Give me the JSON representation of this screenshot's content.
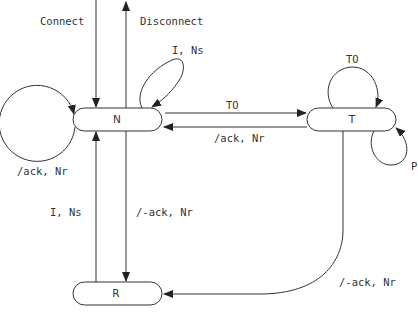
{
  "diagram": {
    "type": "state-transition",
    "nodes": [
      {
        "id": "N",
        "label": "N"
      },
      {
        "id": "T",
        "label": "T"
      },
      {
        "id": "R",
        "label": "R"
      }
    ],
    "edges": [
      {
        "id": "connect",
        "from": "external",
        "to": "N",
        "label": "Connect"
      },
      {
        "id": "disconnect",
        "from": "N",
        "to": "external",
        "label": "Disconnect"
      },
      {
        "id": "n-self-ins",
        "from": "N",
        "to": "N",
        "label": "I, Ns"
      },
      {
        "id": "n-self-ack",
        "from": "N",
        "to": "N",
        "label": "/ack, Nr"
      },
      {
        "id": "n-to-t",
        "from": "N",
        "to": "T",
        "label": "TO"
      },
      {
        "id": "t-to-n",
        "from": "T",
        "to": "N",
        "label": "/ack, Nr"
      },
      {
        "id": "t-self-to",
        "from": "T",
        "to": "T",
        "label": "TO"
      },
      {
        "id": "t-self-p",
        "from": "T",
        "to": "T",
        "label": "P"
      },
      {
        "id": "r-to-n",
        "from": "R",
        "to": "N",
        "label": "I, Ns"
      },
      {
        "id": "n-to-r",
        "from": "N",
        "to": "R",
        "label": "/-ack, Nr"
      },
      {
        "id": "t-to-r",
        "from": "T",
        "to": "R",
        "label": "/-ack, Nr"
      }
    ]
  },
  "labels": {
    "node_n": "N",
    "node_t": "T",
    "node_r": "R",
    "connect": "Connect",
    "disconnect": "Disconnect",
    "n_self_ins": "I, Ns",
    "n_self_ack": "/ack, Nr",
    "n_to_t": "TO",
    "t_to_n": "/ack, Nr",
    "t_self_to": "TO",
    "t_self_p": "P",
    "r_to_n": "I, Ns",
    "n_to_r": "/-ack, Nr",
    "t_to_r": "/-ack, Nr"
  },
  "colors": {
    "stroke": "#333333",
    "text": "#333333",
    "background": "#ffffff"
  }
}
